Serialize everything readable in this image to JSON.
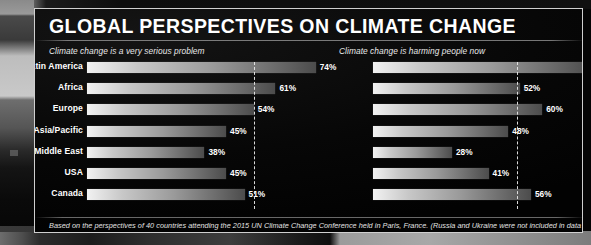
{
  "poster": {
    "title": "GLOBAL PERSPECTIVES ON CLIMATE CHANGE",
    "footnote": "Based on the perspectives of 40 countries attending the 2015 UN Climate Change Conference held in Paris, France. (Russia and Ukraine were not included in data for Europe.)",
    "background_color": "#070707",
    "text_color": "#ffffff",
    "bar_color_light": "#f2f2f2",
    "bar_color_dark": "#4c4c4c",
    "median_line_color": "#e6e6e6"
  },
  "chart_data": [
    {
      "type": "bar",
      "orientation": "horizontal",
      "title": "Climate change is a very serious problem",
      "xlabel": "",
      "ylabel": "",
      "xlim": [
        0,
        100
      ],
      "unit": "%",
      "grid": false,
      "legend": "none",
      "categories": [
        "Latin America",
        "Africa",
        "Europe",
        "Asia/Pacific",
        "Middle East",
        "USA",
        "Canada"
      ],
      "values": [
        74,
        61,
        54,
        45,
        38,
        45,
        51
      ],
      "value_labels": [
        "74%",
        "61%",
        "54%",
        "45%",
        "38%",
        "45%",
        "51%"
      ],
      "annotations": [
        {
          "kind": "median-line",
          "value": 54,
          "label": "Global median 54%"
        }
      ]
    },
    {
      "type": "bar",
      "orientation": "horizontal",
      "title": "Climate change is harming people now",
      "xlabel": "",
      "ylabel": "",
      "xlim": [
        0,
        100
      ],
      "unit": "%",
      "grid": false,
      "legend": "none",
      "categories": [
        "Latin America",
        "Africa",
        "Europe",
        "Asia/Pacific",
        "Middle East",
        "USA",
        "Canada"
      ],
      "values": [
        77,
        52,
        60,
        48,
        28,
        41,
        56
      ],
      "value_labels": [
        "77%",
        "52%",
        "60%",
        "48%",
        "28%",
        "41%",
        "56%"
      ],
      "annotations": [
        {
          "kind": "median-line",
          "value": 51,
          "label": "Global median 51%"
        }
      ]
    }
  ]
}
